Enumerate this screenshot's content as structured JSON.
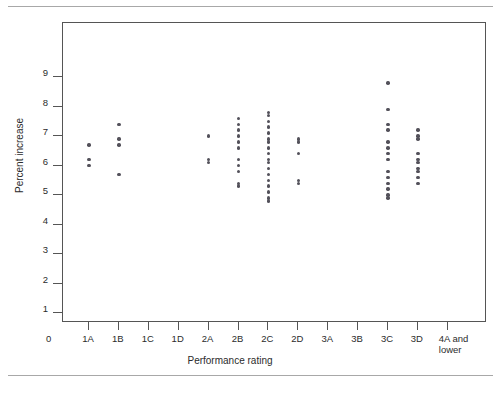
{
  "figure": {
    "has_top_rule": true,
    "has_bottom_rule": true,
    "frame_color": "#555555",
    "point_color": "#53515a"
  },
  "chart_data": {
    "type": "scatter",
    "title": "",
    "xlabel": "Performance rating",
    "ylabel": "Percent increase",
    "grid": false,
    "legend": null,
    "ylim": [
      0,
      9.8
    ],
    "yticks": [
      1,
      2,
      3,
      4,
      5,
      6,
      7,
      8,
      9
    ],
    "ytick_labels": [
      "1",
      "2",
      "3",
      "4",
      "5",
      "6",
      "7",
      "8",
      "9"
    ],
    "x_origin_label": "0",
    "categories": [
      "1A",
      "1B",
      "1C",
      "1D",
      "2A",
      "2B",
      "2C",
      "2D",
      "3A",
      "3B",
      "3C",
      "3D",
      "4A and lower"
    ],
    "series": [
      {
        "name": "Percent increase",
        "points_by_category": {
          "1A": [
            6.7,
            6.2,
            6.0
          ],
          "1B": [
            7.4,
            6.9,
            6.7,
            5.7
          ],
          "1C": [],
          "1D": [],
          "2A": [
            7.0,
            6.2,
            6.1
          ],
          "2B": [
            7.6,
            7.4,
            7.2,
            7.0,
            6.8,
            6.6,
            6.2,
            6.0,
            5.8,
            5.4,
            5.3
          ],
          "2C": [
            7.8,
            7.7,
            7.5,
            7.3,
            7.1,
            6.9,
            6.8,
            6.6,
            6.4,
            6.2,
            6.1,
            5.9,
            5.7,
            5.5,
            5.3,
            5.1,
            4.9,
            4.8
          ],
          "2D": [
            6.9,
            6.8,
            6.4,
            5.5,
            5.4
          ],
          "3A": [],
          "3B": [],
          "3C": [
            8.8,
            7.9,
            7.4,
            7.2,
            6.8,
            6.6,
            6.4,
            6.2,
            5.8,
            5.6,
            5.4,
            5.2,
            5.0,
            4.9
          ],
          "3D": [
            7.2,
            7.0,
            6.9,
            6.4,
            6.2,
            6.1,
            5.9,
            5.8,
            5.6,
            5.4
          ],
          "4A and lower": []
        }
      }
    ]
  }
}
